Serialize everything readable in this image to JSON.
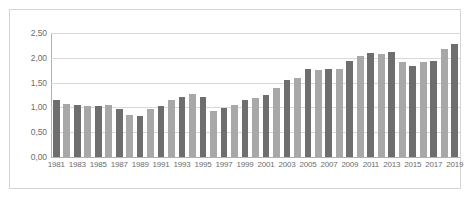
{
  "chart_data": {
    "type": "bar",
    "title": "",
    "subtitle": "",
    "xlabel": "",
    "ylabel": "",
    "ylim": [
      0,
      2.5
    ],
    "ytick_labels": [
      "2,50",
      "2,00",
      "1,50",
      "1,00",
      "0,50",
      "0,00"
    ],
    "ytick_values": [
      2.5,
      2.0,
      1.5,
      1.0,
      0.5,
      0.0
    ],
    "grid": true,
    "legend": null,
    "decimal_separator": ",",
    "categories": [
      "1981",
      "1982",
      "1983",
      "1984",
      "1985",
      "1986",
      "1987",
      "1988",
      "1989",
      "1990",
      "1991",
      "1992",
      "1993",
      "1994",
      "1995",
      "1996",
      "1997",
      "1998",
      "1999",
      "2000",
      "2001",
      "2002",
      "2003",
      "2004",
      "2005",
      "2006",
      "2007",
      "2008",
      "2009",
      "2010",
      "2011",
      "2012",
      "2013",
      "2014",
      "2015",
      "2016",
      "2017",
      "2018",
      "2019"
    ],
    "xtick_labels": [
      "1981",
      "1983",
      "1985",
      "1987",
      "1989",
      "1991",
      "1993",
      "1995",
      "1997",
      "1999",
      "2001",
      "2003",
      "2005",
      "2007",
      "2009",
      "2011",
      "2013",
      "2015",
      "2017",
      "2019"
    ],
    "values": [
      1.14,
      1.06,
      1.05,
      1.03,
      1.03,
      1.05,
      0.96,
      0.84,
      0.83,
      0.96,
      1.03,
      1.14,
      1.22,
      1.27,
      1.21,
      0.93,
      0.99,
      1.05,
      1.15,
      1.18,
      1.26,
      1.39,
      1.56,
      1.6,
      1.78,
      1.75,
      1.77,
      1.78,
      1.94,
      2.03,
      2.09,
      2.07,
      2.12,
      1.92,
      1.84,
      1.91,
      1.93,
      2.18,
      2.28
    ],
    "bar_colors_cycle": [
      "#6e6e6e",
      "#a8a8a8"
    ],
    "colors": {
      "bar_dark": "#6e6e6e",
      "bar_light": "#a8a8a8",
      "gridline": "#d9d9d9",
      "axis": "#b0b0b0",
      "tick_text": "#6d6d6d",
      "frame_border": "#d4d4d4",
      "background": "#ffffff"
    }
  }
}
